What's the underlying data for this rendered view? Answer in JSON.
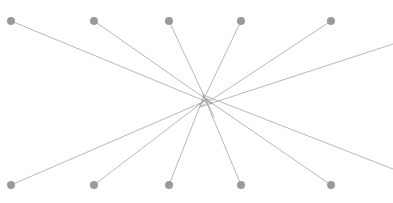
{
  "figure": {
    "type": "node-link-diagram",
    "title": "",
    "width": 393,
    "height": 203,
    "background_color": "#ffffff"
  },
  "style": {
    "node_fill": "#9a9a9a",
    "node_radius": 4,
    "edge_color": "#9a9a9a",
    "edge_width": 0.7
  },
  "hub": {
    "label": "center",
    "x": 206,
    "y": 100
  },
  "nodes": [
    {
      "id": "t1",
      "label": "top-1",
      "x": 11,
      "y": 21
    },
    {
      "id": "t2",
      "label": "top-2",
      "x": 94,
      "y": 21
    },
    {
      "id": "t3",
      "label": "top-3",
      "x": 169,
      "y": 21
    },
    {
      "id": "t4",
      "label": "top-4",
      "x": 241,
      "y": 21
    },
    {
      "id": "t5",
      "label": "top-5",
      "x": 331,
      "y": 21
    },
    {
      "id": "b1",
      "label": "bottom-1",
      "x": 11,
      "y": 185
    },
    {
      "id": "b2",
      "label": "bottom-2",
      "x": 94,
      "y": 185
    },
    {
      "id": "b3",
      "label": "bottom-3",
      "x": 169,
      "y": 185
    },
    {
      "id": "b4",
      "label": "bottom-4",
      "x": 241,
      "y": 185
    },
    {
      "id": "b5",
      "label": "bottom-5",
      "x": 331,
      "y": 185
    }
  ],
  "edges": [
    {
      "id": "e1",
      "label": "top-1-to-center",
      "x1": 11,
      "y1": 21,
      "x2": 212,
      "y2": 104
    },
    {
      "id": "e2",
      "label": "top-2-to-center",
      "x1": 94,
      "y1": 21,
      "x2": 213,
      "y2": 104
    },
    {
      "id": "e3",
      "label": "top-3-to-center",
      "x1": 169,
      "y1": 21,
      "x2": 214,
      "y2": 117
    },
    {
      "id": "e4",
      "label": "top-4-to-center",
      "x1": 241,
      "y1": 21,
      "x2": 200,
      "y2": 107
    },
    {
      "id": "e5",
      "label": "top-5-to-center",
      "x1": 331,
      "y1": 21,
      "x2": 202,
      "y2": 106
    },
    {
      "id": "e6",
      "label": "bottom-1-to-center",
      "x1": 11,
      "y1": 185,
      "x2": 210,
      "y2": 99
    },
    {
      "id": "e7",
      "label": "bottom-2-to-center",
      "x1": 94,
      "y1": 185,
      "x2": 208,
      "y2": 98
    },
    {
      "id": "e8",
      "label": "bottom-3-to-center",
      "x1": 169,
      "y1": 185,
      "x2": 204,
      "y2": 96
    },
    {
      "id": "e9",
      "label": "bottom-4-to-center",
      "x1": 241,
      "y1": 185,
      "x2": 203,
      "y2": 94
    },
    {
      "id": "e10",
      "label": "bottom-5-to-center",
      "x1": 331,
      "y1": 185,
      "x2": 203,
      "y2": 97
    },
    {
      "id": "e11",
      "label": "center-to-right-upper",
      "x1": 200,
      "y1": 107,
      "x2": 393,
      "y2": 44
    },
    {
      "id": "e12",
      "label": "center-to-right-lower",
      "x1": 203,
      "y1": 95,
      "x2": 393,
      "y2": 169
    }
  ]
}
